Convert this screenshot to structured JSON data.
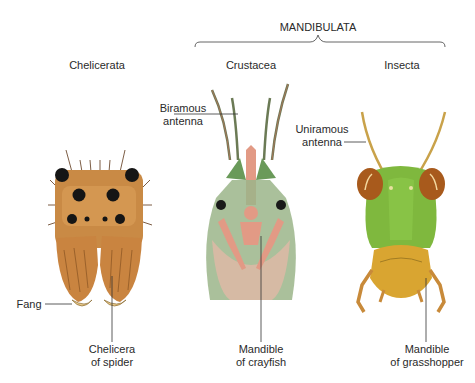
{
  "diagram": {
    "group_label": "MANDIBULATA",
    "columns": [
      {
        "title": "Chelicerata"
      },
      {
        "title": "Crustacea"
      },
      {
        "title": "Insecta"
      }
    ],
    "labels": {
      "fang": "Fang",
      "chelicera_line1": "Chelicera",
      "chelicera_line2": "of spider",
      "biramous_line1": "Biramous",
      "biramous_line2": "antenna",
      "mandible_crayfish_line1": "Mandible",
      "mandible_crayfish_line2": "of crayfish",
      "uniramous_line1": "Uniramous",
      "uniramous_line2": "antenna",
      "mandible_grasshopper_line1": "Mandible",
      "mandible_grasshopper_line2": "of grasshopper"
    },
    "colors": {
      "spider_body": "#c98a45",
      "spider_light": "#e0a862",
      "crayfish_green": "#7a9a6a",
      "crayfish_pink": "#e29a85",
      "grasshopper_green": "#7fb83e",
      "grasshopper_mandible": "#d9a531",
      "grasshopper_eye": "#a85a1c"
    }
  }
}
